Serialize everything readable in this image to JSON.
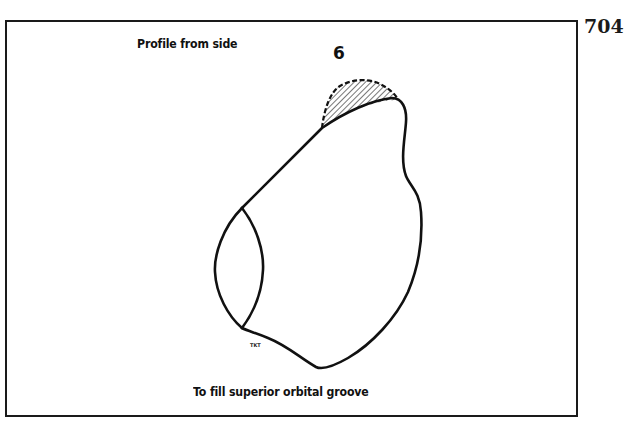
{
  "page": {
    "page_number": "704"
  },
  "figure": {
    "number": "6",
    "caption_top": "Profile from side",
    "caption_bottom": "To fill superior orbital groove",
    "artist_initials": "TKT",
    "shapes": [
      {
        "name": "orbital-implant-profile-outline",
        "style": "solid"
      },
      {
        "name": "anterior-oval-face",
        "style": "solid"
      },
      {
        "name": "superior-fill-region",
        "style": "hatched",
        "border": "dashed"
      }
    ]
  },
  "colors": {
    "ink": "#111111",
    "frame": "#1a1a1a",
    "background": "#ffffff",
    "hatch": "#555555"
  }
}
